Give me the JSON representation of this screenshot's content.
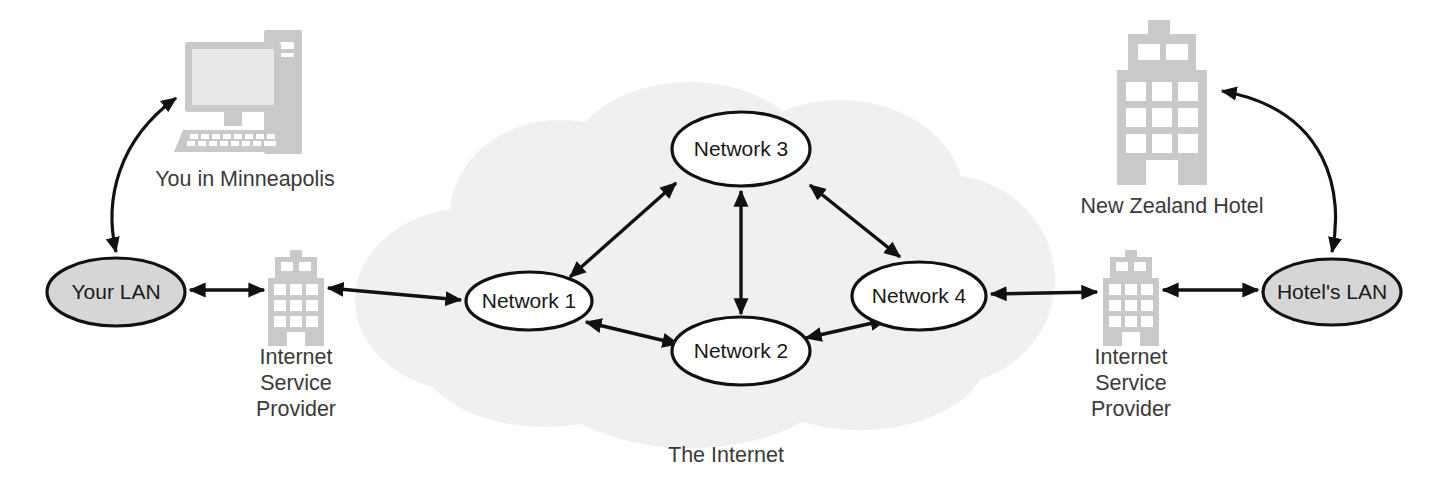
{
  "diagram": {
    "background_color": "#ffffff",
    "cloud_color": "#f0f0f0",
    "lan_fill_color": "#d6d6d6",
    "network_fill_color": "#ffffff",
    "stroke_color": "#111111",
    "icon_color": "#c9c9c9",
    "text_color": "#3a3a3a"
  },
  "nodes": {
    "your_lan": {
      "label": "Your LAN",
      "type": "lan-ellipse"
    },
    "hotel_lan": {
      "label": "Hotel's LAN",
      "type": "lan-ellipse"
    },
    "network_1": {
      "label": "Network 1",
      "type": "network-ellipse"
    },
    "network_2": {
      "label": "Network 2",
      "type": "network-ellipse"
    },
    "network_3": {
      "label": "Network 3",
      "type": "network-ellipse"
    },
    "network_4": {
      "label": "Network 4",
      "type": "network-ellipse"
    }
  },
  "captions": {
    "computer": "You in Minneapolis",
    "isp_left_line1": "Internet",
    "isp_left_line2": "Service",
    "isp_left_line3": "Provider",
    "isp_right_line1": "Internet",
    "isp_right_line2": "Service",
    "isp_right_line3": "Provider",
    "hotel": "New Zealand Hotel",
    "cloud": "The Internet"
  },
  "icons": {
    "computer": "desktop-computer-icon",
    "isp_left": "office-building-icon",
    "isp_right": "office-building-icon",
    "hotel": "hotel-building-icon",
    "cloud": "internet-cloud-icon"
  },
  "connections": [
    {
      "from": "your_lan",
      "to": "computer",
      "style": "curved",
      "arrows": "both"
    },
    {
      "from": "your_lan",
      "to": "isp_left",
      "style": "straight",
      "arrows": "both"
    },
    {
      "from": "isp_left",
      "to": "network_1",
      "style": "straight",
      "arrows": "both"
    },
    {
      "from": "network_1",
      "to": "network_3",
      "style": "straight",
      "arrows": "both"
    },
    {
      "from": "network_1",
      "to": "network_2",
      "style": "straight",
      "arrows": "both"
    },
    {
      "from": "network_2",
      "to": "network_3",
      "style": "straight",
      "arrows": "both"
    },
    {
      "from": "network_2",
      "to": "network_4",
      "style": "straight",
      "arrows": "both"
    },
    {
      "from": "network_3",
      "to": "network_4",
      "style": "straight",
      "arrows": "both"
    },
    {
      "from": "network_4",
      "to": "isp_right",
      "style": "straight",
      "arrows": "both"
    },
    {
      "from": "isp_right",
      "to": "hotel_lan",
      "style": "straight",
      "arrows": "both"
    },
    {
      "from": "hotel_lan",
      "to": "hotel",
      "style": "curved",
      "arrows": "both"
    }
  ]
}
